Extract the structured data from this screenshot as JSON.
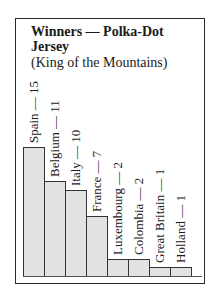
{
  "chart_data": {
    "type": "bar",
    "title": "Winners — Polka-Dot Jersey",
    "subtitle": "(King of the Mountains)",
    "categories": [
      "Spain",
      "Belgium",
      "Italy",
      "France",
      "Luxembourg",
      "Colombia",
      "Great Britain",
      "Holland"
    ],
    "values": [
      15,
      11,
      10,
      7,
      2,
      2,
      1,
      1
    ],
    "labels": [
      "Spain — 15",
      "Belgium — 11",
      "Italy — 10",
      "France — 7",
      "Luxembourg — 2",
      "Colombia — 2",
      "Great Britain — 1",
      "Holland — 1"
    ],
    "xlabel": "",
    "ylabel": "",
    "grid": false,
    "legend": "none",
    "bar_color": "#e2e2e2"
  },
  "title_line1": "Winners — Polka-Dot",
  "title_line2": "Jersey",
  "subtitle": "(King of the Mountains)"
}
